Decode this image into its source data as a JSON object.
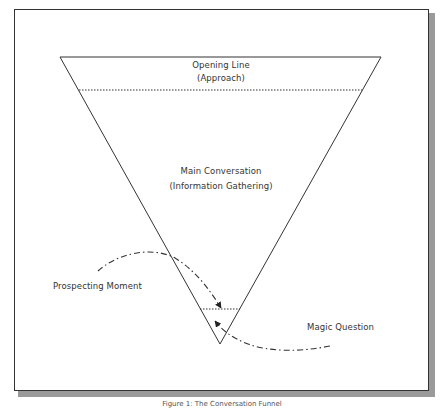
{
  "figure": {
    "caption": "Figure 1: The Conversation Funnel",
    "sections": [
      {
        "line1": "Opening Line",
        "line2": "(Approach)"
      },
      {
        "line1": "Main Conversation",
        "line2": "(Information Gathering)"
      }
    ],
    "callouts": {
      "left": "Prospecting Moment",
      "right": "Magic Question"
    },
    "colors": {
      "line": "#333333",
      "text": "#333333",
      "shadow": "#9a9a9a",
      "background": "#ffffff"
    }
  }
}
